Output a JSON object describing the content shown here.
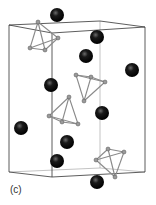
{
  "figure": {
    "panel_label": "(c)",
    "colors": {
      "large_atom": "#111111",
      "small_atom": "#9a9a9a",
      "bond": "#8a8a8a",
      "cell_edge": "#333333"
    },
    "large_atom_count": 10,
    "tetrahedron_count": 4
  }
}
